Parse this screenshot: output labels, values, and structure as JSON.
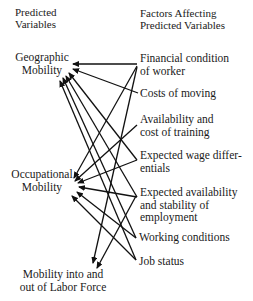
{
  "headers": {
    "left_line1": "Predicted",
    "left_line2": "Variables",
    "right_line1": "Factors Affecting",
    "right_line2": "Predicted Variables"
  },
  "predicted": [
    {
      "id": "geographic",
      "line1": "Geographic",
      "line2": "Mobility"
    },
    {
      "id": "occupational",
      "line1": "Occupational",
      "line2": "Mobility"
    },
    {
      "id": "labor_force",
      "line1": "Mobility into and",
      "line2": "out of Labor Force"
    }
  ],
  "factors": [
    {
      "id": "financial",
      "line1": "Financial condition",
      "line2": "of worker"
    },
    {
      "id": "costs",
      "line1": "Costs of moving",
      "line2": ""
    },
    {
      "id": "training",
      "line1": "Availability and",
      "line2": "cost of training"
    },
    {
      "id": "wage",
      "line1": "Expected wage differ-",
      "line2": "entials"
    },
    {
      "id": "employment",
      "line1": "Expected availability",
      "line2": "and stability of",
      "line3": "employment"
    },
    {
      "id": "working",
      "line1": "Working conditions",
      "line2": ""
    },
    {
      "id": "job_status",
      "line1": "Job status",
      "line2": ""
    }
  ],
  "edges": [
    {
      "from": "financial",
      "to": "geographic"
    },
    {
      "from": "costs",
      "to": "geographic"
    },
    {
      "from": "wage",
      "to": "geographic"
    },
    {
      "from": "employment",
      "to": "geographic"
    },
    {
      "from": "working",
      "to": "geographic"
    },
    {
      "from": "job_status",
      "to": "geographic"
    },
    {
      "from": "financial",
      "to": "occupational"
    },
    {
      "from": "training",
      "to": "occupational"
    },
    {
      "from": "wage",
      "to": "occupational"
    },
    {
      "from": "employment",
      "to": "occupational"
    },
    {
      "from": "working",
      "to": "occupational"
    },
    {
      "from": "job_status",
      "to": "occupational"
    },
    {
      "from": "financial",
      "to": "labor_force"
    },
    {
      "from": "training",
      "to": "labor_force"
    }
  ],
  "colors": {
    "line": "#111111",
    "text": "#1a1a1a",
    "background": "#ffffff"
  }
}
